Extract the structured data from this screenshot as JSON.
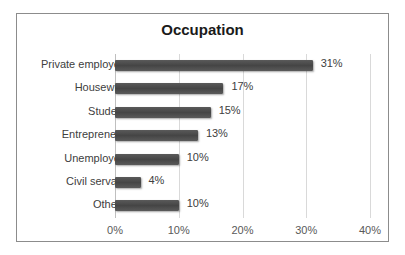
{
  "chart_data": {
    "type": "bar",
    "orientation": "horizontal",
    "title": "Occupation",
    "categories": [
      "Private employee",
      "Housewife",
      "Student",
      "Entrepreneur",
      "Unemployed",
      "Civil servant",
      "Others"
    ],
    "values": [
      31,
      17,
      15,
      13,
      10,
      4,
      10
    ],
    "value_labels": [
      "31%",
      "17%",
      "15%",
      "13%",
      "10%",
      "4%",
      "10%"
    ],
    "xlabel": "",
    "ylabel": "",
    "xlim": [
      0,
      40
    ],
    "x_ticks": [
      "0%",
      "10%",
      "20%",
      "30%",
      "40%"
    ],
    "grid": true,
    "legend": null,
    "bar_color": "#4d4d4d"
  }
}
